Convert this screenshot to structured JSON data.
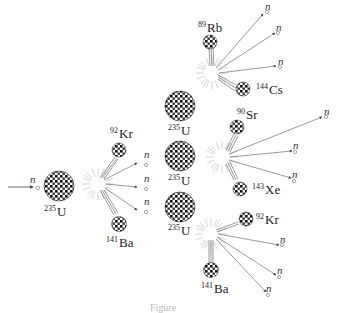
{
  "diagram": {
    "neutron_symbol": "n",
    "incoming": {
      "label": "n"
    },
    "stages": [
      {
        "name": "first-fission",
        "nucleus": {
          "mass": "235",
          "symbol": "U"
        },
        "products": [
          {
            "mass": "92",
            "symbol": "Kr"
          },
          {
            "mass": "141",
            "symbol": "Ba"
          }
        ],
        "neutrons": [
          "n",
          "n",
          "n"
        ]
      },
      {
        "name": "second-fission-top",
        "nucleus": {
          "mass": "235",
          "symbol": "U"
        },
        "products": [
          {
            "mass": "89",
            "symbol": "Rb"
          },
          {
            "mass": "144",
            "symbol": "Cs"
          }
        ],
        "neutrons": [
          "n",
          "n",
          "n"
        ]
      },
      {
        "name": "second-fission-middle",
        "nucleus": {
          "mass": "235",
          "symbol": "U"
        },
        "products": [
          {
            "mass": "90",
            "symbol": "Sr"
          },
          {
            "mass": "143",
            "symbol": "Xe"
          }
        ],
        "neutrons": [
          "n",
          "n",
          "n"
        ]
      },
      {
        "name": "second-fission-bottom",
        "nucleus": {
          "mass": "235",
          "symbol": "U"
        },
        "products": [
          {
            "mass": "92",
            "symbol": "Kr"
          },
          {
            "mass": "141",
            "symbol": "Ba"
          }
        ],
        "neutrons": [
          "n",
          "n",
          "n"
        ]
      }
    ],
    "caption": "Figure"
  },
  "colors": {
    "line": "#555555",
    "nucleus_dark": "#1a1a1a",
    "background": "#ffffff"
  }
}
